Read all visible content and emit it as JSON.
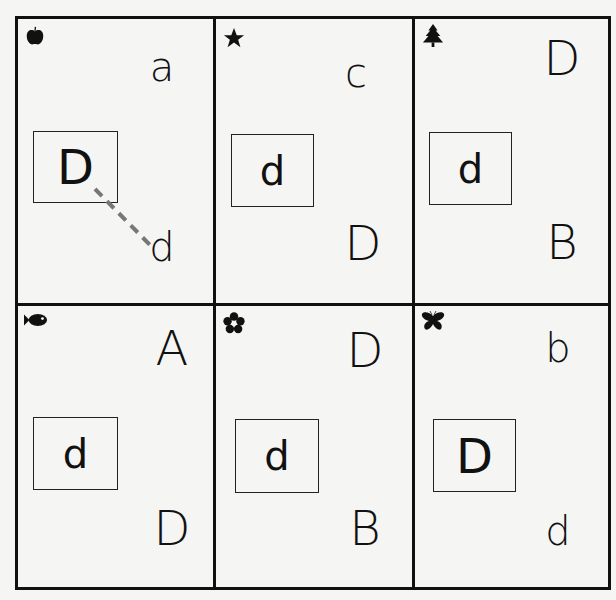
{
  "worksheet": {
    "layout": {
      "rows": 2,
      "cols": 3
    },
    "colors": {
      "ink": "#111111",
      "answer_line": "#777777",
      "paper": "#f5f5f3"
    },
    "cells": [
      {
        "icon": "apple-icon",
        "target": "D",
        "choices": [
          {
            "letter": "a",
            "position": "top"
          },
          {
            "letter": "d",
            "position": "bottom"
          }
        ],
        "answer_drawn": "d"
      },
      {
        "icon": "star-icon",
        "target": "d",
        "choices": [
          {
            "letter": "c",
            "position": "top"
          },
          {
            "letter": "D",
            "position": "bottom"
          }
        ]
      },
      {
        "icon": "tree-icon",
        "target": "d",
        "choices": [
          {
            "letter": "D",
            "position": "top"
          },
          {
            "letter": "B",
            "position": "bottom"
          }
        ]
      },
      {
        "icon": "fish-icon",
        "target": "d",
        "choices": [
          {
            "letter": "A",
            "position": "top"
          },
          {
            "letter": "D",
            "position": "bottom"
          }
        ]
      },
      {
        "icon": "flower-icon",
        "target": "d",
        "choices": [
          {
            "letter": "D",
            "position": "top"
          },
          {
            "letter": "B",
            "position": "bottom"
          }
        ]
      },
      {
        "icon": "butterfly-icon",
        "target": "D",
        "choices": [
          {
            "letter": "b",
            "position": "top"
          },
          {
            "letter": "d",
            "position": "bottom"
          }
        ]
      }
    ]
  }
}
